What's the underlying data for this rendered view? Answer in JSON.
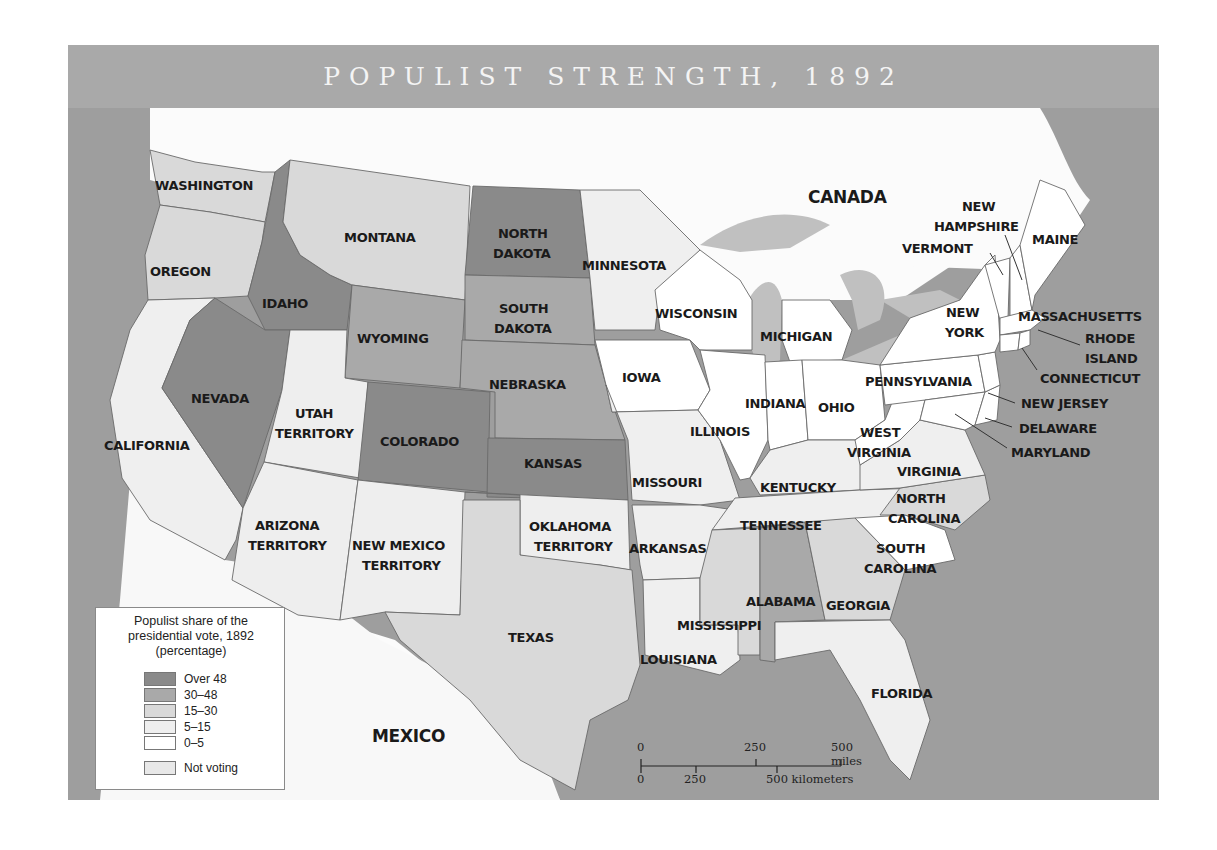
{
  "title": "POPULIST STRENGTH, 1892",
  "colors": {
    "over_48": "#8a8a8a",
    "30_48": "#a9a9a9",
    "15_30": "#d9d9d9",
    "5_15": "#efefef",
    "0_5": "#ffffff",
    "not_voting": "#e8e8e8",
    "water": "#9e9e9e",
    "lakes": "#c0c0c0",
    "title_band": "#a9a9a9"
  },
  "legend": {
    "title_line1": "Populist share of the",
    "title_line2": "presidential vote, 1892",
    "title_line3": "(percentage)",
    "items": [
      {
        "label": "Over 48",
        "key": "over_48"
      },
      {
        "label": "30–48",
        "key": "30_48"
      },
      {
        "label": "15–30",
        "key": "15_30"
      },
      {
        "label": "5–15",
        "key": "5_15"
      },
      {
        "label": "0–5",
        "key": "0_5"
      },
      {
        "label": "Not voting",
        "key": "not_voting"
      }
    ]
  },
  "scale_bar": {
    "miles_0": "0",
    "miles_250": "250",
    "miles_500": "500 miles",
    "km_0": "0",
    "km_250": "250",
    "km_500": "500 kilometers"
  },
  "regions": {
    "canada": "CANADA",
    "mexico": "MEXICO"
  },
  "states": {
    "washington": {
      "name": "WASHINGTON",
      "category": "15_30"
    },
    "oregon": {
      "name": "OREGON",
      "category": "15_30"
    },
    "california": {
      "name": "CALIFORNIA",
      "category": "5_15"
    },
    "idaho": {
      "name": "IDAHO",
      "category": "over_48"
    },
    "nevada": {
      "name": "NEVADA",
      "category": "over_48"
    },
    "montana": {
      "name": "MONTANA",
      "category": "15_30"
    },
    "wyoming": {
      "name": "WYOMING",
      "category": "30_48"
    },
    "utah": {
      "name_l1": "UTAH",
      "name_l2": "TERRITORY",
      "category": "not_voting"
    },
    "colorado": {
      "name": "COLORADO",
      "category": "over_48"
    },
    "arizona": {
      "name_l1": "ARIZONA",
      "name_l2": "TERRITORY",
      "category": "not_voting"
    },
    "new_mexico": {
      "name_l1": "NEW MEXICO",
      "name_l2": "TERRITORY",
      "category": "not_voting"
    },
    "north_dakota": {
      "name_l1": "NORTH",
      "name_l2": "DAKOTA",
      "category": "over_48"
    },
    "south_dakota": {
      "name_l1": "SOUTH",
      "name_l2": "DAKOTA",
      "category": "30_48"
    },
    "nebraska": {
      "name": "NEBRASKA",
      "category": "30_48"
    },
    "kansas": {
      "name": "KANSAS",
      "category": "over_48"
    },
    "oklahoma": {
      "name_l1": "OKLAHOMA",
      "name_l2": "TERRITORY",
      "category": "not_voting"
    },
    "texas": {
      "name": "TEXAS",
      "category": "15_30"
    },
    "minnesota": {
      "name": "MINNESOTA",
      "category": "5_15"
    },
    "iowa": {
      "name": "IOWA",
      "category": "0_5"
    },
    "missouri": {
      "name": "MISSOURI",
      "category": "5_15"
    },
    "arkansas": {
      "name": "ARKANSAS",
      "category": "5_15"
    },
    "louisiana": {
      "name": "LOUISIANA",
      "category": "5_15"
    },
    "wisconsin": {
      "name": "WISCONSIN",
      "category": "0_5"
    },
    "illinois": {
      "name": "ILLINOIS",
      "category": "0_5"
    },
    "michigan": {
      "name": "MICHIGAN",
      "category": "0_5"
    },
    "indiana": {
      "name": "INDIANA",
      "category": "0_5"
    },
    "ohio": {
      "name": "OHIO",
      "category": "0_5"
    },
    "kentucky": {
      "name": "KENTUCKY",
      "category": "5_15"
    },
    "tennessee": {
      "name": "TENNESSEE",
      "category": "5_15"
    },
    "mississippi": {
      "name": "MISSISSIPPI",
      "category": "15_30"
    },
    "alabama": {
      "name": "ALABAMA",
      "category": "30_48"
    },
    "georgia": {
      "name": "GEORGIA",
      "category": "15_30"
    },
    "florida": {
      "name": "FLORIDA",
      "category": "5_15"
    },
    "south_carolina": {
      "name_l1": "SOUTH",
      "name_l2": "CAROLINA",
      "category": "0_5"
    },
    "north_carolina": {
      "name_l1": "NORTH",
      "name_l2": "CAROLINA",
      "category": "15_30"
    },
    "virginia": {
      "name": "VIRGINIA",
      "category": "5_15"
    },
    "west_virginia": {
      "name_l1": "WEST",
      "name_l2": "VIRGINIA",
      "category": "0_5"
    },
    "pennsylvania": {
      "name": "PENNSYLVANIA",
      "category": "0_5"
    },
    "new_york": {
      "name_l1": "NEW",
      "name_l2": "YORK",
      "category": "0_5"
    },
    "vermont": {
      "name": "VERMONT",
      "category": "0_5"
    },
    "new_hampshire": {
      "name_l1": "NEW",
      "name_l2": "HAMPSHIRE",
      "category": "0_5"
    },
    "maine": {
      "name": "MAINE",
      "category": "0_5"
    },
    "massachusetts": {
      "name": "MASSACHUSETTS",
      "category": "0_5"
    },
    "rhode_island": {
      "name_l1": "RHODE",
      "name_l2": "ISLAND",
      "category": "0_5"
    },
    "connecticut": {
      "name": "CONNECTICUT",
      "category": "0_5"
    },
    "new_jersey": {
      "name": "NEW JERSEY",
      "category": "0_5"
    },
    "delaware": {
      "name": "DELAWARE",
      "category": "0_5"
    },
    "maryland": {
      "name": "MARYLAND",
      "category": "0_5"
    }
  }
}
